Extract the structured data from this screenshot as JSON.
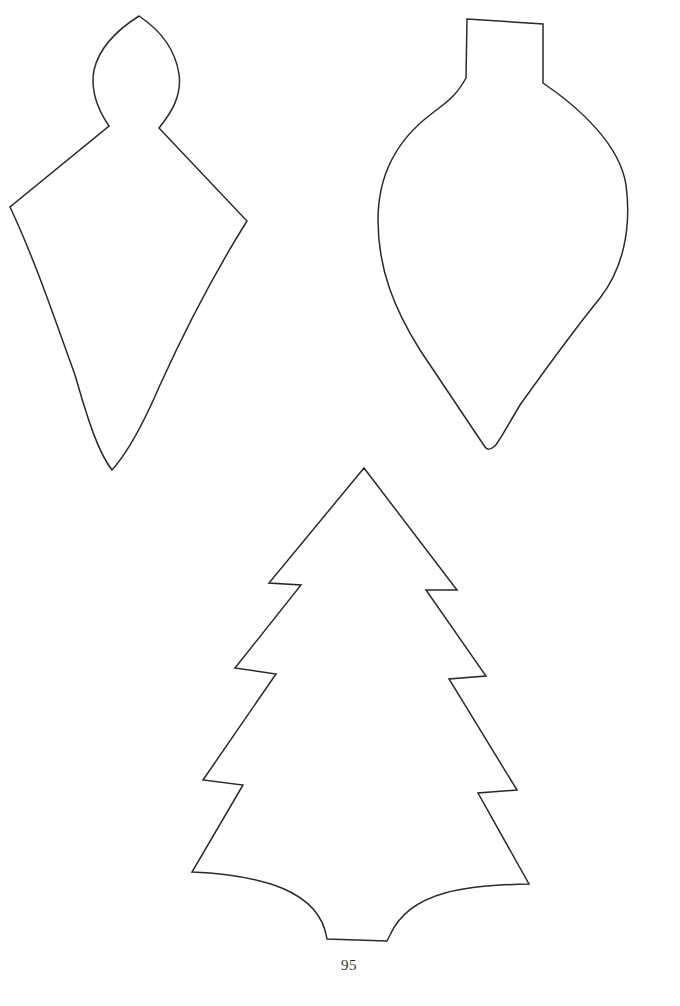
{
  "page": {
    "number": "95",
    "background": "#ffffff",
    "stroke_color": "#2a2a2a"
  },
  "templates": [
    {
      "name": "diamond-drop-ornament",
      "label": "Diamond drop ornament with pointed cap"
    },
    {
      "name": "teardrop-ornament",
      "label": "Teardrop bulb ornament with rectangular cap"
    },
    {
      "name": "christmas-tree",
      "label": "Christmas tree with three tiers and scalloped base"
    }
  ]
}
